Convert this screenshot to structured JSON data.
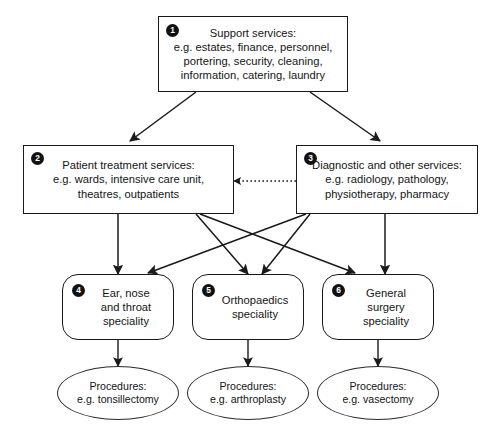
{
  "diagram": {
    "type": "flow-hierarchy",
    "colors": {
      "stroke": "#1a1a1a",
      "text": "#141414",
      "background": "#ffffff",
      "badge_fill": "#111111",
      "badge_text": "#ffffff"
    },
    "nodes": [
      {
        "id": "support-services",
        "badge": "1",
        "shape": "rectangle",
        "text": "Support services:\ne.g. estates, finance, personnel,\nportering, security, cleaning,\ninformation, catering, laundry"
      },
      {
        "id": "patient-treatment-services",
        "badge": "2",
        "shape": "rectangle",
        "text": "Patient treatment services:\ne.g. wards, intensive care unit,\ntheatres, outpatients"
      },
      {
        "id": "diagnostic-and-other-services",
        "badge": "3",
        "shape": "rectangle",
        "text": "Diagnostic and other services:\ne.g. radiology, pathology,\nphysiotherapy, pharmacy"
      },
      {
        "id": "ent-speciality",
        "badge": "4",
        "shape": "rounded-rectangle",
        "text": "Ear, nose\nand throat\nspeciality"
      },
      {
        "id": "orthopaedics-speciality",
        "badge": "5",
        "shape": "rounded-rectangle",
        "text": "Orthopaedics\nspeciality"
      },
      {
        "id": "general-surgery-speciality",
        "badge": "6",
        "shape": "rounded-rectangle",
        "text": "General\nsurgery\nspeciality"
      },
      {
        "id": "procedures-tonsillectomy",
        "badge": "",
        "shape": "ellipse",
        "text": "Procedures:\ne.g. tonsillectomy"
      },
      {
        "id": "procedures-arthroplasty",
        "badge": "",
        "shape": "ellipse",
        "text": "Procedures:\ne.g. arthroplasty"
      },
      {
        "id": "procedures-vasectomy",
        "badge": "",
        "shape": "ellipse",
        "text": "Procedures:\ne.g. vasectomy"
      }
    ],
    "edges": [
      {
        "from": "support-services",
        "to": "patient-treatment-services",
        "style": "solid",
        "arrow": "single"
      },
      {
        "from": "support-services",
        "to": "diagnostic-and-other-services",
        "style": "solid",
        "arrow": "single"
      },
      {
        "from": "diagnostic-and-other-services",
        "to": "patient-treatment-services",
        "style": "dotted",
        "arrow": "single"
      },
      {
        "from": "patient-treatment-services",
        "to": "ent-speciality",
        "style": "solid",
        "arrow": "single"
      },
      {
        "from": "patient-treatment-services",
        "to": "orthopaedics-speciality",
        "style": "solid",
        "arrow": "single"
      },
      {
        "from": "patient-treatment-services",
        "to": "general-surgery-speciality",
        "style": "solid",
        "arrow": "single"
      },
      {
        "from": "diagnostic-and-other-services",
        "to": "ent-speciality",
        "style": "solid",
        "arrow": "single"
      },
      {
        "from": "diagnostic-and-other-services",
        "to": "orthopaedics-speciality",
        "style": "solid",
        "arrow": "single"
      },
      {
        "from": "diagnostic-and-other-services",
        "to": "general-surgery-speciality",
        "style": "solid",
        "arrow": "single"
      },
      {
        "from": "ent-speciality",
        "to": "procedures-tonsillectomy",
        "style": "solid",
        "arrow": "single"
      },
      {
        "from": "orthopaedics-speciality",
        "to": "procedures-arthroplasty",
        "style": "solid",
        "arrow": "single"
      },
      {
        "from": "general-surgery-speciality",
        "to": "procedures-vasectomy",
        "style": "solid",
        "arrow": "single"
      }
    ]
  }
}
